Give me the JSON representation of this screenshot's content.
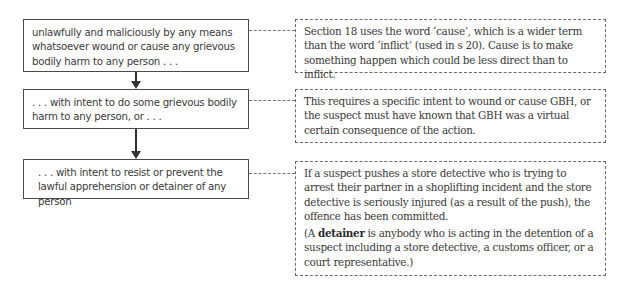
{
  "diagram": {
    "steps": [
      {
        "text": "unlawfully and maliciously by any means whatsoever wound or cause any grievous bodily harm to any person . . ."
      },
      {
        "text": ". . . with intent to do some grievous bodily harm to any person, or . . ."
      },
      {
        "text": ". . . with intent to resist or prevent the lawful apprehension or detainer of any person"
      }
    ],
    "notes": [
      {
        "p1": "Section 18 uses the word ‘cause’, which is a wider term than the word ‘inflict’ (used in s 20). Cause is to make something happen which could be less direct than to inflict."
      },
      {
        "p1": "This requires a specific intent to wound or cause GBH, or the suspect must have known that GBH was a virtual certain consequence of the action."
      },
      {
        "p1": "If a suspect pushes a store detective who is trying to arrest their partner in a shoplifting incident and the store detective is seriously injured (as a result of the push), the offence has been committed.",
        "p2_prefix": "(A ",
        "p2_term": "detainer",
        "p2_rest": " is anybody who is acting in the detention of a suspect including a store detective, a customs officer, or a court representative.)"
      }
    ]
  }
}
